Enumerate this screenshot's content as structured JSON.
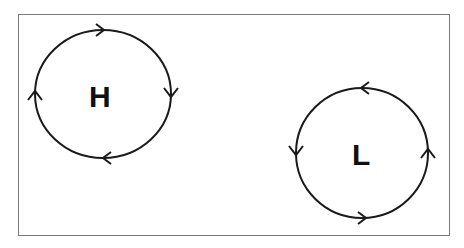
{
  "diagram": {
    "type": "pressure-systems",
    "systems": [
      {
        "label": "H",
        "name": "high-pressure",
        "rotation": "clockwise"
      },
      {
        "label": "L",
        "name": "low-pressure",
        "rotation": "counterclockwise"
      }
    ]
  },
  "colors": {
    "stroke": "#1a1a1a",
    "border": "#7a7a7a",
    "background": "#ffffff"
  }
}
